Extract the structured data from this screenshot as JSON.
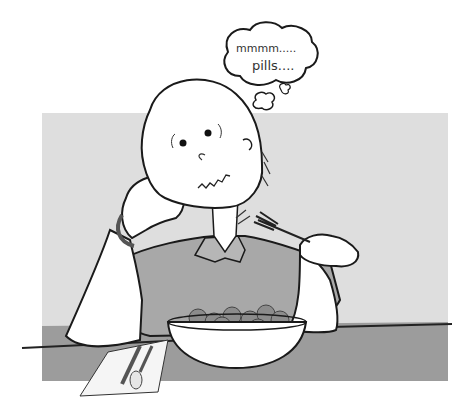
{
  "illustration": {
    "subject": "bald cartoon man resting head on hand, looking at a bowl of pills",
    "thought_bubble": {
      "line1": "mmmm.....",
      "line2": "pills...."
    }
  },
  "colors": {
    "background": "#ffffff",
    "wall": "#dedede",
    "table": "#9a9a9a",
    "shirt": "#a9a9a9",
    "skin": "#ffffff",
    "outline": "#1a1a1a",
    "pills": "#8a8a8a",
    "napkin": "#f4f4f4"
  }
}
